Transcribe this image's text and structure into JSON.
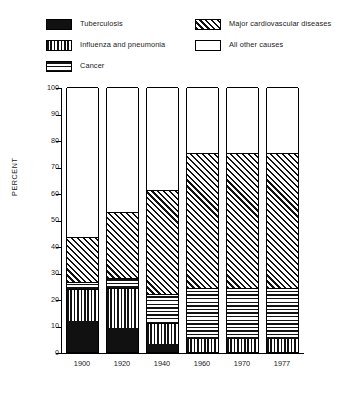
{
  "legend": {
    "columns": [
      {
        "entries": [
          {
            "label": "Tuberculosis",
            "pattern": "solid"
          },
          {
            "label": "Influenza and pneumonia",
            "pattern": "vertical"
          },
          {
            "label": "Cancer",
            "pattern": "horizontal"
          }
        ]
      },
      {
        "entries": [
          {
            "label": "Major cardiovascular diseases",
            "pattern": "diagonal"
          },
          {
            "label": "All other causes",
            "pattern": "empty"
          }
        ]
      }
    ]
  },
  "axes": {
    "ylabel": "PERCENT",
    "yticks": [
      "100",
      "90",
      "80",
      "70",
      "60",
      "50",
      "40",
      "30",
      "20",
      "10",
      "0"
    ],
    "xticks": [
      "1900",
      "1920",
      "1940",
      "1960",
      "1970",
      "1977"
    ]
  },
  "chart_data": {
    "type": "bar",
    "title": "",
    "subtitle": "",
    "xlabel": "",
    "ylabel": "PERCENT",
    "ylim": [
      0,
      100
    ],
    "ytick_step": 10,
    "grid": false,
    "stacked": true,
    "legend_position": "top",
    "categories": [
      "1900",
      "1920",
      "1940",
      "1960",
      "1970",
      "1977"
    ],
    "series": [
      {
        "name": "Tuberculosis",
        "pattern": "solid",
        "values": [
          11.7,
          9.0,
          3.0,
          0.0,
          0.0,
          0.0
        ]
      },
      {
        "name": "Influenza and pneumonia",
        "pattern": "vertical",
        "values": [
          12.1,
          15.0,
          8.0,
          5.0,
          5.0,
          5.0
        ]
      },
      {
        "name": "Cancer",
        "pattern": "horizontal",
        "values": [
          2.6,
          4.0,
          11.0,
          19.0,
          19.0,
          19.0
        ]
      },
      {
        "name": "Major cardiovascular diseases",
        "pattern": "diagonal",
        "values": [
          17.0,
          25.0,
          39.0,
          51.0,
          51.0,
          51.0
        ]
      },
      {
        "name": "All other causes",
        "pattern": "empty",
        "values": [
          56.6,
          47.0,
          39.0,
          25.0,
          25.0,
          25.0
        ]
      }
    ],
    "cumulative_tops": {
      "1900": [
        11.7,
        23.8,
        26.4,
        43.4,
        100
      ],
      "1920": [
        9.0,
        24.0,
        28.0,
        53.0,
        100
      ],
      "1940": [
        3.0,
        11.0,
        22.0,
        61.0,
        100
      ],
      "1960": [
        0.0,
        5.0,
        24.0,
        75.0,
        100
      ],
      "1970": [
        0.0,
        5.0,
        24.0,
        75.0,
        100
      ],
      "1977": [
        0.0,
        5.0,
        24.0,
        75.0,
        100
      ]
    }
  }
}
